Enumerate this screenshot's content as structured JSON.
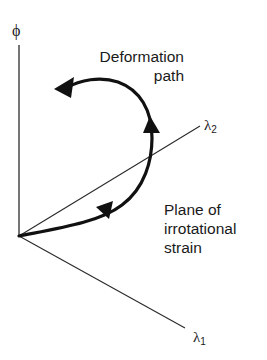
{
  "diagram": {
    "axes": {
      "phi": {
        "label": "ϕ"
      },
      "lambda2": {
        "symbol": "λ",
        "subscript": "2"
      },
      "lambda1": {
        "symbol": "λ",
        "subscript": "1"
      }
    },
    "annotations": {
      "deformation_path": {
        "line1": "Deformation",
        "line2": "path"
      },
      "plane": {
        "line1": "Plane of",
        "line2": "irrotational",
        "line3": "strain"
      }
    },
    "colors": {
      "ink": "#1a1a1a",
      "background": "#ffffff"
    }
  }
}
